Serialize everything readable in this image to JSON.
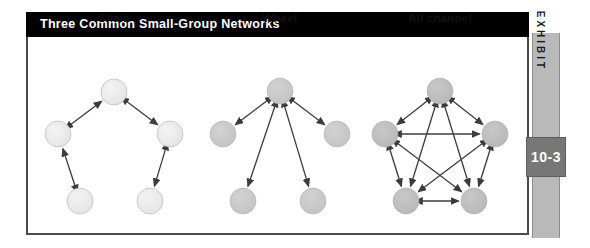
{
  "exhibit": {
    "title": "Three Common Small-Group Networks",
    "tab_label": "EXHIBIT",
    "number": "10-3",
    "colors": {
      "banner_background": "#000000",
      "banner_text": "#ffffff",
      "frame_border": "#4a4a4a",
      "page_background": "#ffffff",
      "tab_background": "#b9b9b9",
      "number_box_background": "#777777",
      "node_light": "#e8e8e8",
      "node_mid": "#c9c9c9",
      "node_dark": "#bfbfbf",
      "node_stroke": "#b0b0b0",
      "arrow": "#3c3c3c"
    }
  },
  "networks": [
    {
      "id": "chain",
      "label": "Chain",
      "node_fill": "#e9e9e9",
      "node_count": 5,
      "description": "Five nodes arranged in an open arc connected end to end by two-way arrows."
    },
    {
      "id": "wheel",
      "label": "Wheel",
      "node_fill": "#c9c9c9",
      "node_count": 5,
      "description": "A central hub node connected by two-way arrows to four surrounding nodes."
    },
    {
      "id": "all-channel",
      "label": "All channel",
      "node_fill": "#bdbdbd",
      "node_count": 5,
      "description": "Five nodes in a pentagon, every node connected to every other node by two-way arrows."
    }
  ],
  "chart_data": {
    "type": "diagram",
    "title": "Three Common Small-Group Networks",
    "diagrams": [
      {
        "name": "Chain",
        "nodes": [
          {
            "id": "c1",
            "x": 114,
            "y": 92
          },
          {
            "id": "c2",
            "x": 58,
            "y": 134
          },
          {
            "id": "c3",
            "x": 170,
            "y": 134
          },
          {
            "id": "c4",
            "x": 80,
            "y": 201
          },
          {
            "id": "c5",
            "x": 150,
            "y": 201
          }
        ],
        "edges": [
          {
            "from": "c4",
            "to": "c2"
          },
          {
            "from": "c2",
            "to": "c1"
          },
          {
            "from": "c1",
            "to": "c3"
          },
          {
            "from": "c3",
            "to": "c5"
          }
        ],
        "edge_style": "double-arrow",
        "node_radius": 13
      },
      {
        "name": "Wheel",
        "nodes": [
          {
            "id": "w0",
            "x": 280,
            "y": 91
          },
          {
            "id": "w1",
            "x": 223,
            "y": 134
          },
          {
            "id": "w2",
            "x": 337,
            "y": 134
          },
          {
            "id": "w3",
            "x": 243,
            "y": 201
          },
          {
            "id": "w4",
            "x": 313,
            "y": 201
          }
        ],
        "edges": [
          {
            "from": "w0",
            "to": "w1"
          },
          {
            "from": "w0",
            "to": "w2"
          },
          {
            "from": "w0",
            "to": "w3"
          },
          {
            "from": "w0",
            "to": "w4"
          }
        ],
        "edge_style": "double-arrow",
        "node_radius": 13
      },
      {
        "name": "All channel",
        "nodes": [
          {
            "id": "a1",
            "x": 440,
            "y": 91
          },
          {
            "id": "a2",
            "x": 385,
            "y": 134
          },
          {
            "id": "a3",
            "x": 495,
            "y": 134
          },
          {
            "id": "a4",
            "x": 406,
            "y": 201
          },
          {
            "id": "a5",
            "x": 474,
            "y": 201
          }
        ],
        "edges": [
          {
            "from": "a1",
            "to": "a2"
          },
          {
            "from": "a1",
            "to": "a3"
          },
          {
            "from": "a1",
            "to": "a4"
          },
          {
            "from": "a1",
            "to": "a5"
          },
          {
            "from": "a2",
            "to": "a3"
          },
          {
            "from": "a2",
            "to": "a4"
          },
          {
            "from": "a2",
            "to": "a5"
          },
          {
            "from": "a3",
            "to": "a4"
          },
          {
            "from": "a3",
            "to": "a5"
          },
          {
            "from": "a4",
            "to": "a5"
          }
        ],
        "edge_style": "double-arrow",
        "node_radius": 13
      }
    ]
  }
}
